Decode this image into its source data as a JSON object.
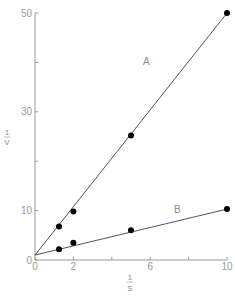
{
  "chart_data": {
    "type": "scatter",
    "title": "",
    "xlabel": "1/S",
    "ylabel": "1/V",
    "xlabel_parts": {
      "numerator": "1",
      "denominator": "S"
    },
    "ylabel_parts": {
      "numerator": "1",
      "denominator": "V"
    },
    "xlim": [
      0,
      10
    ],
    "ylim": [
      0,
      50
    ],
    "x_ticks": [
      0,
      2,
      4,
      6,
      8,
      10
    ],
    "x_tick_labels": [
      "0",
      "2",
      "",
      "6",
      "",
      "10"
    ],
    "y_ticks": [
      0,
      10,
      20,
      30,
      40,
      50
    ],
    "y_tick_labels": [
      "0",
      "10",
      "",
      "30",
      "",
      "50"
    ],
    "grid": false,
    "legend": "inline labels",
    "series": [
      {
        "name": "A",
        "points": [
          [
            1.25,
            6.8
          ],
          [
            2,
            9.8
          ],
          [
            5,
            25.2
          ],
          [
            10,
            50
          ]
        ],
        "fit_line": {
          "x0": 0,
          "y0": 1,
          "x1": 10,
          "y1": 50
        }
      },
      {
        "name": "B",
        "points": [
          [
            1.25,
            2.2
          ],
          [
            2,
            3.5
          ],
          [
            5,
            6.0
          ],
          [
            10,
            10.3
          ]
        ],
        "fit_line": {
          "x0": 0,
          "y0": 1,
          "x1": 10,
          "y1": 10.3
        }
      }
    ]
  },
  "labels": {
    "series_a": "A",
    "series_b": "B",
    "x_num": "1",
    "x_den": "S",
    "y_num": "1",
    "y_den": "V"
  },
  "colors": {
    "axis": "#9a9a9a",
    "line": "#555555",
    "point": "#000000"
  }
}
